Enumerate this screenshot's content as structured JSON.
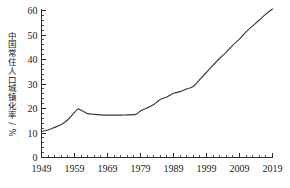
{
  "chart_data": {
    "type": "line",
    "title": "",
    "subtitle": "",
    "xlabel": "",
    "ylabel": "中国常住人口城镇化率/%",
    "xlim": [
      1949,
      2019
    ],
    "ylim": [
      0,
      60
    ],
    "grid": false,
    "legend": null,
    "y_ticks": [
      "0",
      "10",
      "20",
      "30",
      "40",
      "50",
      "60"
    ],
    "y_tick_values": [
      0,
      10,
      20,
      30,
      40,
      50,
      60
    ],
    "y_minor_step": 2,
    "x_ticks": [
      "1949",
      "1959",
      "1969",
      "1979",
      "1989",
      "1999",
      "2009",
      "2019"
    ],
    "x_tick_values": [
      1949,
      1959,
      1969,
      1979,
      1989,
      1999,
      2009,
      2019
    ],
    "x_minor_step": 2,
    "series": [
      {
        "name": "中国常住人口城镇化率",
        "x": [
          1949,
          1951,
          1953,
          1955,
          1957,
          1959,
          1960,
          1961,
          1962,
          1963,
          1965,
          1967,
          1969,
          1971,
          1973,
          1975,
          1977,
          1978,
          1979,
          1981,
          1983,
          1985,
          1987,
          1989,
          1991,
          1993,
          1995,
          1997,
          1999,
          2001,
          2003,
          2005,
          2007,
          2009,
          2011,
          2013,
          2015,
          2017,
          2019
        ],
        "values": [
          10.6,
          11.2,
          12.3,
          13.5,
          15.4,
          18.4,
          19.8,
          19.3,
          18.6,
          17.9,
          17.6,
          17.4,
          17.3,
          17.3,
          17.3,
          17.4,
          17.5,
          17.9,
          19.0,
          20.2,
          21.6,
          23.7,
          24.7,
          26.2,
          26.9,
          28.0,
          29.0,
          31.9,
          34.8,
          37.7,
          40.5,
          43.0,
          45.9,
          48.3,
          51.3,
          53.7,
          56.1,
          58.5,
          60.6
        ]
      }
    ],
    "annotations": [],
    "line_color": "#3a3a3a",
    "axis_color": "#2b2b2b",
    "background_color": "#ffffff"
  }
}
